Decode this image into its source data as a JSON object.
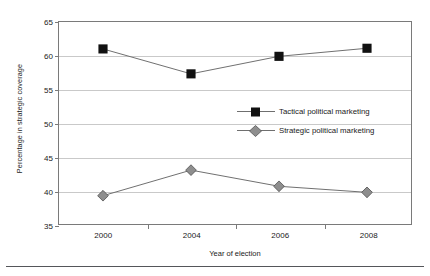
{
  "chart_data": {
    "type": "line",
    "title": "",
    "subtitle": "",
    "xlabel": "Year of election",
    "ylabel": "Percentage in strategic coverage",
    "categories": [
      "2000",
      "2004",
      "2006",
      "2008"
    ],
    "x": [
      2000,
      2004,
      2006,
      2008
    ],
    "ylim": [
      35,
      65
    ],
    "yticks": [
      35,
      40,
      45,
      50,
      55,
      60,
      65
    ],
    "ytick_labels": [
      "35",
      "40",
      "45",
      "50",
      "55",
      "60",
      "65"
    ],
    "grid": "horizontal",
    "legend_position": "center-right-inside",
    "series": [
      {
        "name": "Tactical political marketing",
        "marker": "square",
        "marker_color": "#111111",
        "line_color": "#6f6f6f",
        "values": [
          61.0,
          57.3,
          59.9,
          61.1
        ]
      },
      {
        "name": "Strategic political marketing",
        "marker": "diamond",
        "marker_color": "#8e8e8e",
        "line_color": "#6f6f6f",
        "values": [
          39.2,
          43.0,
          40.6,
          39.7
        ]
      }
    ],
    "annotations": []
  },
  "legend": {
    "items": [
      {
        "label": "Tactical political marketing"
      },
      {
        "label": "Strategic political marketing"
      }
    ]
  },
  "axes": {
    "x_title": "Year of election",
    "y_title": "Percentage in strategic coverage"
  },
  "colors": {
    "frame": "#7a7a7a",
    "grid": "#c9c9c9",
    "series_tactical": "#111111",
    "series_strategic": "#8e8e8e",
    "line": "#6f6f6f",
    "text": "#1a1a1a",
    "footer_rule": "#55565a"
  }
}
